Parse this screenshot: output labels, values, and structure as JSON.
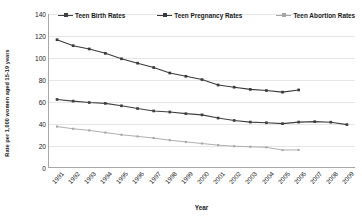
{
  "chart_data": {
    "type": "line",
    "title": "",
    "xlabel": "Year",
    "ylabel": "Rate per 1,000 women aged 15-19 years",
    "x": [
      1991,
      1992,
      1993,
      1994,
      1995,
      1996,
      1997,
      1998,
      1999,
      2000,
      2001,
      2002,
      2003,
      2004,
      2005,
      2006,
      2007,
      2008,
      2009
    ],
    "xtick_labels": [
      "1991",
      "1992",
      "1993",
      "1994",
      "1995",
      "1996",
      "1997",
      "1998",
      "1999",
      "2000",
      "2001",
      "2002",
      "2003",
      "2004",
      "2005",
      "2006",
      "2007",
      "2008",
      "2009"
    ],
    "ytick_labels": [
      "0",
      "20",
      "40",
      "60",
      "80",
      "100",
      "120",
      "140"
    ],
    "ytick_values": [
      0,
      20,
      40,
      60,
      80,
      100,
      120,
      140
    ],
    "ylim": [
      0,
      140
    ],
    "grid": true,
    "legend_position": "top",
    "series": [
      {
        "name": "Teen Birth Rates",
        "color": "#404040",
        "values": [
          61.8,
          60.3,
          59.0,
          58.2,
          56.0,
          53.5,
          51.3,
          50.3,
          48.8,
          47.7,
          44.8,
          42.6,
          41.1,
          40.5,
          39.7,
          41.1,
          41.5,
          41.0,
          38.8
        ]
      },
      {
        "name": "Teen Pregnancy Rates",
        "color": "#3a3a3a",
        "values": [
          116.5,
          111.0,
          108.0,
          104.0,
          99.0,
          95.0,
          91.0,
          86.0,
          83.0,
          80.0,
          75.0,
          73.0,
          71.0,
          70.0,
          68.5,
          70.5,
          null,
          null,
          null
        ]
      },
      {
        "name": "Teen Abortion Rates",
        "color": "#a6a6a6",
        "values": [
          37.0,
          35.0,
          33.5,
          31.5,
          29.5,
          28.0,
          26.5,
          24.5,
          23.0,
          21.5,
          20.0,
          19.0,
          18.5,
          18.0,
          15.5,
          15.6,
          null,
          null,
          null
        ]
      }
    ]
  }
}
